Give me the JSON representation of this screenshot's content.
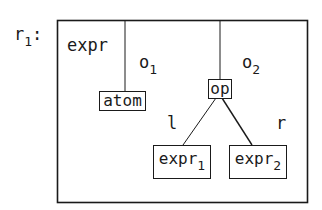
{
  "diagram": {
    "rule_label": {
      "base": "r",
      "sub": "1",
      "suffix": ":"
    },
    "frame_label": "expr",
    "operand_labels": [
      {
        "base": "o",
        "sub": "1"
      },
      {
        "base": "o",
        "sub": "2"
      }
    ],
    "nodes": {
      "atom": "atom",
      "op": "op",
      "left_child": {
        "base": "expr",
        "sub": "1"
      },
      "right_child": {
        "base": "expr",
        "sub": "2"
      }
    },
    "edge_labels": {
      "left": "l",
      "right": "r"
    },
    "colors": {
      "ink": "#1a1a1a",
      "background": "#ffffff"
    }
  }
}
